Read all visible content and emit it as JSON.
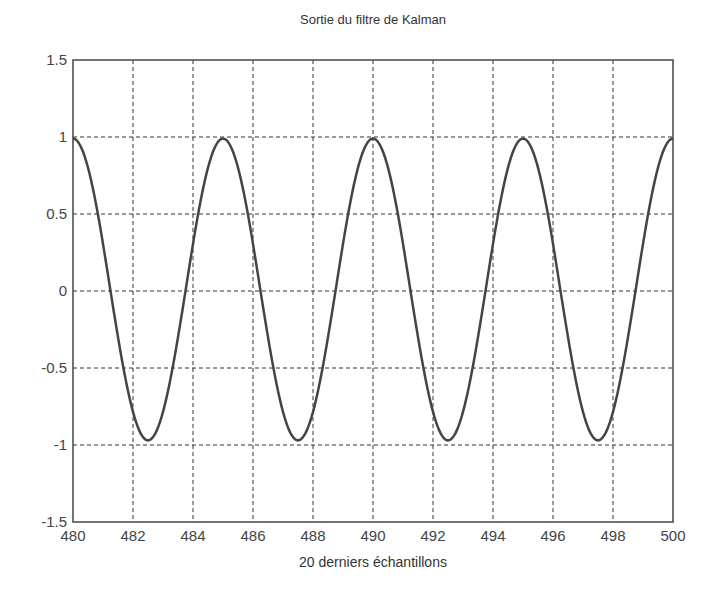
{
  "chart_data": {
    "type": "line",
    "title": "Sortie du filtre de Kalman",
    "xlabel": "20 derniers échantillons",
    "ylabel": "",
    "xlim": [
      480,
      500
    ],
    "ylim": [
      -1.5,
      1.5
    ],
    "grid": true,
    "legend": null,
    "x_ticks": [
      480,
      482,
      484,
      486,
      488,
      490,
      492,
      494,
      496,
      498,
      500
    ],
    "y_ticks": [
      1.5,
      1,
      0.5,
      0,
      -0.5,
      -1,
      -1.5
    ],
    "x_tick_labels": [
      "480",
      "482",
      "484",
      "486",
      "488",
      "490",
      "492",
      "494",
      "496",
      "498",
      "500"
    ],
    "y_tick_labels": [
      "1.5",
      "1",
      "0.5",
      "0",
      "-0.5",
      "-1",
      "-1.5"
    ],
    "series": [
      {
        "name": "Sortie du filtre",
        "color": "#444444",
        "description": "cosine, period 5 samples, amplitude ~0.98",
        "x": [
          480,
          481.25,
          482.5,
          483.75,
          485,
          486.25,
          487.5,
          488.75,
          490,
          491.25,
          492.5,
          493.75,
          495,
          496.25,
          497.5,
          498.75,
          500
        ],
        "y": [
          0.99,
          0.0,
          -0.97,
          0.0,
          0.99,
          0.0,
          -0.97,
          0.0,
          0.99,
          0.0,
          -0.97,
          0.0,
          0.99,
          0.0,
          -0.97,
          0.0,
          0.98
        ]
      }
    ]
  },
  "layout": {
    "plot": {
      "left": 73,
      "top": 60,
      "right": 673,
      "bottom": 522
    }
  }
}
